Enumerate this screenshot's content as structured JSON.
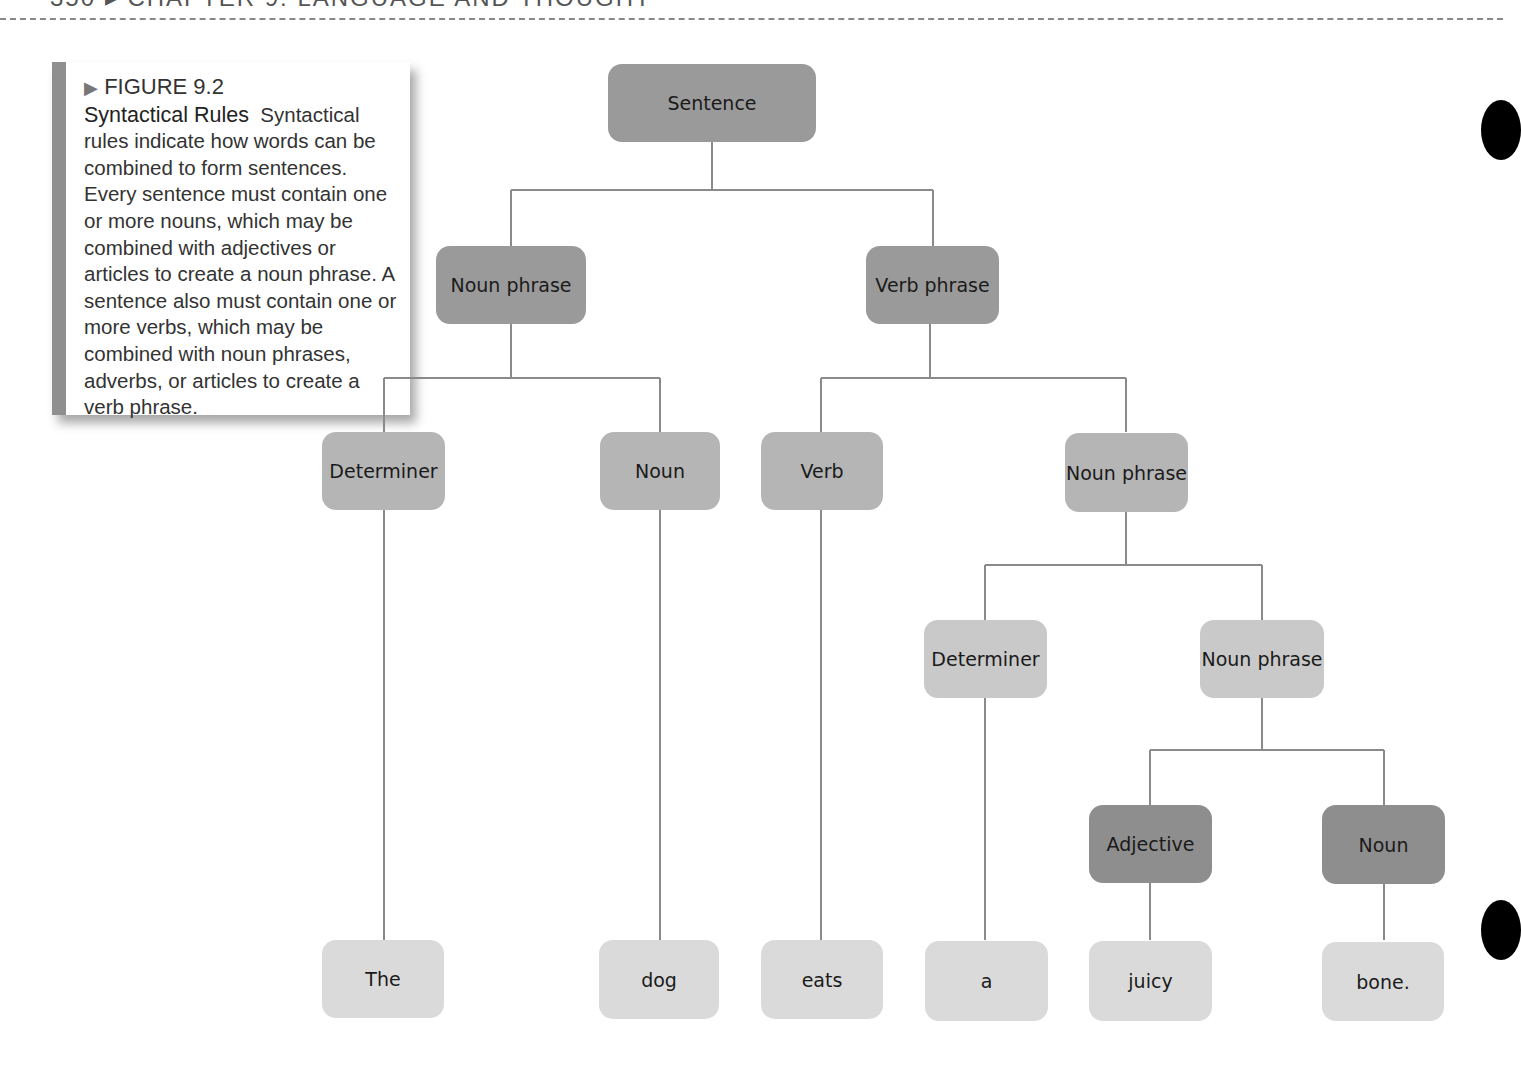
{
  "page_header": {
    "text": "350  ▸  CHAPTER 9: LANGUAGE AND THOUGHT"
  },
  "caption": {
    "figure_label": "FIGURE 9.2",
    "title": "Syntactical Rules",
    "body": "Syntactical rules indicate how words can be combined to form sentences. Every sentence must contain one or more nouns, which may be combined with adjectives or articles to create a noun phrase. A sentence also must contain one or more verbs, which may be combined with noun phrases, adverbs, or articles to create a verb phrase."
  },
  "tree": {
    "root": "Sentence",
    "level1": {
      "left": "Noun phrase",
      "right": "Verb phrase"
    },
    "level2": {
      "np_det": "Determiner",
      "np_noun": "Noun",
      "vp_verb": "Verb",
      "vp_np": "Noun phrase"
    },
    "level3": {
      "det": "Determiner",
      "np": "Noun phrase"
    },
    "level4": {
      "adj": "Adjective",
      "noun": "Noun"
    },
    "words": [
      "The",
      "dog",
      "eats",
      "a",
      "juicy",
      "bone."
    ]
  },
  "colors": {
    "line": "#8a8a8a",
    "darkest": "#8e8e8e",
    "dark": "#9a9a9a",
    "mid": "#b5b5b5",
    "light": "#c9c9c9",
    "lightest": "#dadada"
  }
}
